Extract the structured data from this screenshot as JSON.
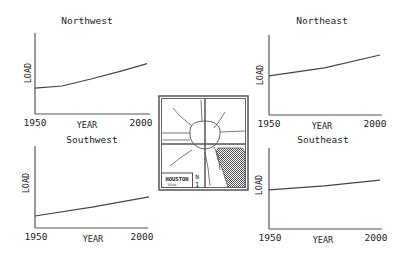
{
  "colors": {
    "line": "#444444",
    "axis": "#555555",
    "text": "#222222",
    "water": "#555555"
  },
  "map": {
    "label": "HOUSTON",
    "sublabel": "TEXAS",
    "north_label": "N",
    "scale_label": "1"
  },
  "chart_data": [
    {
      "type": "line",
      "title": "Northwest",
      "xlabel": "YEAR",
      "ylabel": "LOAD",
      "x_ticks": [
        "1950",
        "2000"
      ],
      "x": [
        1950,
        1962,
        1975,
        1988,
        2000
      ],
      "values": [
        0.37,
        0.4,
        0.5,
        0.61,
        0.72
      ],
      "ylim": [
        0,
        1
      ],
      "grid": false
    },
    {
      "type": "line",
      "title": "Northeast",
      "xlabel": "YEAR",
      "ylabel": "LOAD",
      "x_ticks": [
        "1950",
        "2000"
      ],
      "x": [
        1950,
        1975,
        2000
      ],
      "values": [
        0.49,
        0.59,
        0.75
      ],
      "ylim": [
        0,
        1
      ],
      "grid": false
    },
    {
      "type": "line",
      "title": "Southwest",
      "xlabel": "YEAR",
      "ylabel": "LOAD",
      "x_ticks": [
        "1950",
        "2000"
      ],
      "x": [
        1950,
        1975,
        2000
      ],
      "values": [
        0.15,
        0.26,
        0.39
      ],
      "ylim": [
        0,
        1
      ],
      "grid": false
    },
    {
      "type": "line",
      "title": "Southeast",
      "xlabel": "YEAR",
      "ylabel": "LOAD",
      "x_ticks": [
        "1950",
        "2000"
      ],
      "x": [
        1950,
        1975,
        2000
      ],
      "values": [
        0.49,
        0.54,
        0.61
      ],
      "ylim": [
        0,
        1
      ],
      "grid": false
    }
  ]
}
